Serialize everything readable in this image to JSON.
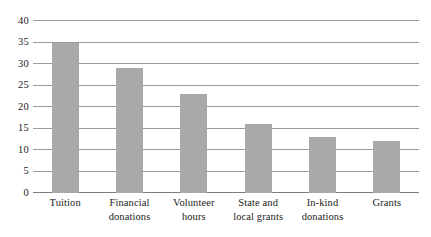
{
  "chart_data": {
    "type": "bar",
    "title": "",
    "subtitle": "",
    "xlabel": "",
    "ylabel": "",
    "categories": [
      "Tuition",
      "Financial\ndonations",
      "Volunteer\nhours",
      "State and\nlocal grants",
      "In-kind\ndonations",
      "Grants"
    ],
    "values": [
      35,
      29,
      23,
      16,
      13,
      12
    ],
    "ylim": [
      0,
      40
    ],
    "ytick_labels": [
      "0",
      "5",
      "10",
      "15",
      "20",
      "25",
      "30",
      "35",
      "40"
    ],
    "ytick_values": [
      0,
      5,
      10,
      15,
      20,
      25,
      30,
      35,
      40
    ],
    "grid": true,
    "legend": false,
    "legend_position": "none",
    "bar_color": "#a9a9a9",
    "gridline_color": "#9a9a9a",
    "axis_color": "#7d7d7d",
    "background_color": "#ffffff"
  }
}
